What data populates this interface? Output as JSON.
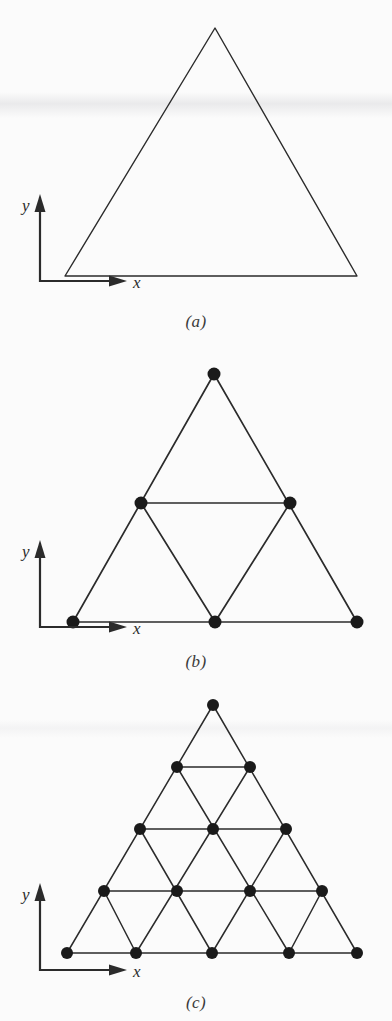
{
  "figure": {
    "background_color": "#fbfbfb",
    "ink_color": "#2b2b2b",
    "node_color": "#1a1a1a"
  },
  "axes": {
    "x_label": "x",
    "y_label": "y"
  },
  "panels": [
    {
      "id": "a",
      "caption": "(a)",
      "description": "Single undivided triangle (coarse domain, no nodes marked)",
      "subdivisions": 1,
      "node_count": 0,
      "element_count": 1,
      "vertices": [
        [
          65,
          276
        ],
        [
          215,
          28
        ],
        [
          357,
          276
        ]
      ],
      "nodes": []
    },
    {
      "id": "b",
      "caption": "(b)",
      "description": "Triangle subdivided into 4 elements with 6 nodes",
      "subdivisions": 2,
      "node_count": 6,
      "element_count": 4,
      "vertices": [
        [
          73,
          622
        ],
        [
          214,
          374
        ],
        [
          357,
          622
        ]
      ],
      "nodes": [
        [
          214,
          374
        ],
        [
          141,
          503
        ],
        [
          290,
          503
        ],
        [
          73,
          622
        ],
        [
          215,
          622
        ],
        [
          357,
          622
        ]
      ]
    },
    {
      "id": "c",
      "caption": "(c)",
      "description": "Triangle subdivided into 16 elements with 15 nodes",
      "subdivisions": 4,
      "node_count": 15,
      "element_count": 16,
      "vertices": [
        [
          67,
          953
        ],
        [
          213,
          705
        ],
        [
          357,
          953
        ]
      ],
      "nodes": [
        [
          213,
          705
        ],
        [
          177,
          767
        ],
        [
          250,
          767
        ],
        [
          140,
          829
        ],
        [
          213,
          829
        ],
        [
          286,
          829
        ],
        [
          104,
          891
        ],
        [
          177,
          891
        ],
        [
          250,
          891
        ],
        [
          322,
          891
        ],
        [
          67,
          953
        ],
        [
          136,
          953
        ],
        [
          212,
          953
        ],
        [
          289,
          953
        ],
        [
          357,
          953
        ]
      ]
    }
  ]
}
